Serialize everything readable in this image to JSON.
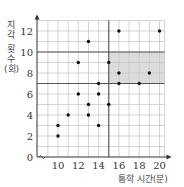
{
  "chart_data": {
    "type": "scatter",
    "title": "",
    "xlabel": "통학 시간(분)",
    "ylabel": "지각 횟수 (회)",
    "ylabel_lines": [
      "지",
      "각",
      "횟",
      "수",
      "(회)"
    ],
    "x_ticks": [
      10,
      12,
      14,
      16,
      18,
      20
    ],
    "y_ticks": [
      0,
      2,
      4,
      6,
      8,
      10,
      12
    ],
    "xlim": [
      8,
      20.5
    ],
    "ylim": [
      0,
      13
    ],
    "grid": true,
    "axis_break": "x-axis starts with break mark (wavy) near origin",
    "legend": null,
    "points": [
      {
        "x": 10,
        "y": 2
      },
      {
        "x": 10,
        "y": 3
      },
      {
        "x": 11,
        "y": 4
      },
      {
        "x": 12,
        "y": 6
      },
      {
        "x": 12,
        "y": 9
      },
      {
        "x": 13,
        "y": 4
      },
      {
        "x": 13,
        "y": 5
      },
      {
        "x": 13,
        "y": 11
      },
      {
        "x": 14,
        "y": 3
      },
      {
        "x": 14,
        "y": 6
      },
      {
        "x": 14,
        "y": 7
      },
      {
        "x": 15,
        "y": 5
      },
      {
        "x": 15,
        "y": 9
      },
      {
        "x": 16,
        "y": 7
      },
      {
        "x": 16,
        "y": 8
      },
      {
        "x": 16,
        "y": 12
      },
      {
        "x": 18,
        "y": 7
      },
      {
        "x": 19,
        "y": 8
      },
      {
        "x": 20,
        "y": 12
      }
    ],
    "highlight_region": {
      "x": [
        15,
        20.5
      ],
      "y": [
        7,
        10
      ],
      "color": "#dcdcdc"
    },
    "reference_lines": {
      "vertical_x": 15,
      "horizontal_y": [
        7,
        10
      ]
    }
  },
  "colors": {
    "grid": "#c8c8c8",
    "reference_line": "#555555",
    "axis": "#333333",
    "point": "#111111",
    "shade": "#dcdcdc"
  }
}
